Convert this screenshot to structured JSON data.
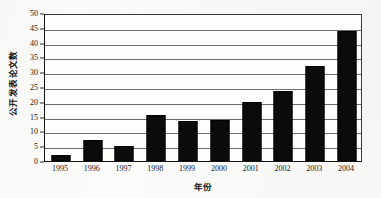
{
  "chart_data": {
    "type": "bar",
    "title": "",
    "subtitle": "",
    "xlabel": "年份",
    "ylabel": "公开发表论文数",
    "categories": [
      "1995",
      "1996",
      "1997",
      "1998",
      "1999",
      "2000",
      "2001",
      "2002",
      "2003",
      "2004"
    ],
    "values": [
      2,
      7,
      5,
      15.5,
      13.5,
      14,
      20,
      23.5,
      32,
      44
    ],
    "series": [
      {
        "name": "公开发表论文数",
        "values": [
          2,
          7,
          5,
          15.5,
          13.5,
          14,
          20,
          23.5,
          32,
          44
        ]
      }
    ],
    "ylim": [
      0,
      50
    ],
    "ytick_values": [
      0,
      5,
      10,
      15,
      20,
      25,
      30,
      35,
      40,
      45,
      50
    ],
    "ytick_labels": [
      "0",
      "5",
      "10",
      "15",
      "20",
      "25",
      "30",
      "35",
      "40",
      "45",
      "50"
    ],
    "ytick_step": 5,
    "grid": true,
    "grid_axis": "y",
    "legend": false,
    "legend_position": "none",
    "bar_color": "#0b0b0b",
    "background_color": "#fbfbfa",
    "axis_color": "#111111",
    "gridline_color": "#6e6e6e",
    "annotations": []
  }
}
